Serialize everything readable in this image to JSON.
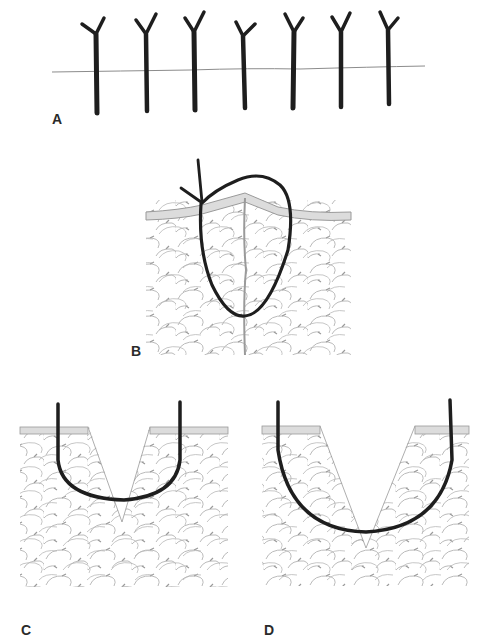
{
  "figure": {
    "panels": [
      {
        "id": "A",
        "label": "A",
        "description": "Row of interrupted sutures across incision line",
        "suture_count": 7
      },
      {
        "id": "B",
        "label": "B",
        "description": "Deep loop suture through epidermis and subcutaneous fat with needle entry"
      },
      {
        "id": "C",
        "label": "C",
        "description": "U-shaped suture in V-shaped wedge wound, shallow bite"
      },
      {
        "id": "D",
        "label": "D",
        "description": "U-shaped suture in V-shaped wedge wound, deep bite"
      }
    ]
  },
  "colors": {
    "suture": "#1e1e1e",
    "skin_surface": "#d9d9d9",
    "skin_edge": "#9a9a9a",
    "tissue_lines": "#a8a8a8",
    "incision_line": "#8c8c8c",
    "background": "#ffffff"
  }
}
